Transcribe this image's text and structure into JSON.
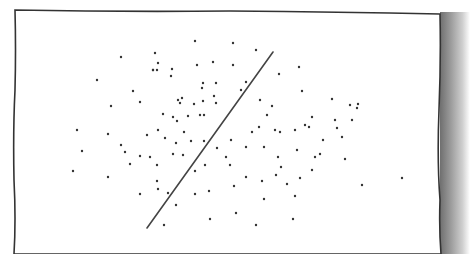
{
  "diagram": {
    "frame": {
      "x1": 15,
      "y1": 10,
      "x2": 441,
      "y2": 254,
      "stroke": "#333333"
    },
    "separator_line": {
      "x1": 147,
      "y1": 228,
      "x2": 273,
      "y2": 52,
      "stroke": "#444444"
    },
    "dot_color": "#333333",
    "points": [
      [
        195,
        41
      ],
      [
        233,
        43
      ],
      [
        155,
        53
      ],
      [
        121,
        57
      ],
      [
        256,
        50
      ],
      [
        158,
        63
      ],
      [
        157,
        70
      ],
      [
        153,
        70
      ],
      [
        172,
        69
      ],
      [
        171,
        76
      ],
      [
        153,
        70
      ],
      [
        213,
        62
      ],
      [
        197,
        65
      ],
      [
        233,
        65
      ],
      [
        246,
        82
      ],
      [
        279,
        74
      ],
      [
        97,
        80
      ],
      [
        203,
        83
      ],
      [
        216,
        83
      ],
      [
        202,
        88
      ],
      [
        182,
        98
      ],
      [
        133,
        91
      ],
      [
        140,
        102
      ],
      [
        178,
        100
      ],
      [
        111,
        106
      ],
      [
        180,
        103
      ],
      [
        163,
        114
      ],
      [
        214,
        96
      ],
      [
        216,
        103
      ],
      [
        204,
        115
      ],
      [
        188,
        116
      ],
      [
        177,
        121
      ],
      [
        241,
        90
      ],
      [
        299,
        67
      ],
      [
        302,
        91
      ],
      [
        260,
        100
      ],
      [
        272,
        106
      ],
      [
        332,
        99
      ],
      [
        358,
        104
      ],
      [
        267,
        115
      ],
      [
        280,
        132
      ],
      [
        295,
        130
      ],
      [
        305,
        125
      ],
      [
        312,
        117
      ],
      [
        335,
        120
      ],
      [
        350,
        105
      ],
      [
        357,
        108
      ],
      [
        173,
        117
      ],
      [
        200,
        115
      ],
      [
        203,
        101
      ],
      [
        194,
        104
      ],
      [
        77,
        130
      ],
      [
        108,
        134
      ],
      [
        82,
        151
      ],
      [
        121,
        145
      ],
      [
        125,
        152
      ],
      [
        147,
        135
      ],
      [
        150,
        157
      ],
      [
        158,
        130
      ],
      [
        165,
        138
      ],
      [
        176,
        143
      ],
      [
        191,
        141
      ],
      [
        183,
        155
      ],
      [
        184,
        132
      ],
      [
        204,
        141
      ],
      [
        231,
        140
      ],
      [
        252,
        132
      ],
      [
        259,
        127
      ],
      [
        275,
        130
      ],
      [
        309,
        127
      ],
      [
        246,
        147
      ],
      [
        264,
        147
      ],
      [
        226,
        157
      ],
      [
        230,
        165
      ],
      [
        278,
        157
      ],
      [
        297,
        150
      ],
      [
        312,
        170
      ],
      [
        323,
        140
      ],
      [
        337,
        128
      ],
      [
        342,
        137
      ],
      [
        345,
        159
      ],
      [
        352,
        120
      ],
      [
        402,
        178
      ],
      [
        362,
        185
      ],
      [
        73,
        171
      ],
      [
        108,
        177
      ],
      [
        130,
        164
      ],
      [
        140,
        156
      ],
      [
        157,
        165
      ],
      [
        173,
        154
      ],
      [
        195,
        171
      ],
      [
        205,
        165
      ],
      [
        217,
        148
      ],
      [
        246,
        177
      ],
      [
        262,
        181
      ],
      [
        281,
        167
      ],
      [
        287,
        184
      ],
      [
        300,
        178
      ],
      [
        295,
        196
      ],
      [
        264,
        199
      ],
      [
        236,
        213
      ],
      [
        210,
        219
      ],
      [
        158,
        189
      ],
      [
        168,
        193
      ],
      [
        176,
        205
      ],
      [
        140,
        194
      ],
      [
        157,
        181
      ],
      [
        164,
        225
      ],
      [
        195,
        194
      ],
      [
        209,
        191
      ],
      [
        293,
        219
      ],
      [
        256,
        225
      ],
      [
        234,
        186
      ],
      [
        276,
        175
      ],
      [
        320,
        154
      ],
      [
        315,
        157
      ]
    ]
  }
}
